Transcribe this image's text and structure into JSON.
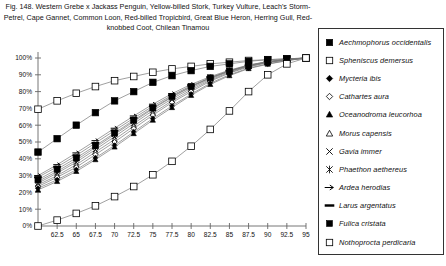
{
  "figure": {
    "caption": "Fig. 148.  Western Grebe x Jackass Penguin, Yellow-billed Stork, Turkey Vulture, Leach's Storm-Petrel, Cape Gannet, Common Loon, Red-billed Tropicbird, Great Blue Heron, Herring Gull, Red-knobbed Coot, Chilean Tinamou"
  },
  "legend": {
    "position": "right",
    "items": [
      {
        "label": "Aechmophorus occidentalis",
        "marker": "filled-square"
      },
      {
        "label": "Spheniscus demersus",
        "marker": "open-square"
      },
      {
        "label": "Mycteria ibis",
        "marker": "filled-diamond"
      },
      {
        "label": "Cathartes aura",
        "marker": "open-diamond"
      },
      {
        "label": "Oceanodroma leucorhoa",
        "marker": "filled-triangle"
      },
      {
        "label": "Morus capensis",
        "marker": "open-triangle"
      },
      {
        "label": "Gavia immer",
        "marker": "cross-x"
      },
      {
        "label": "Phaethon aethereus",
        "marker": "asterisk"
      },
      {
        "label": "Ardea herodias",
        "marker": "dash-arrow"
      },
      {
        "label": "Larus argentatus",
        "marker": "dash"
      },
      {
        "label": "Fulica cristata",
        "marker": "filled-square-small"
      },
      {
        "label": "Nothoprocta perdicaria",
        "marker": "open-square-small"
      }
    ]
  },
  "chart_data": {
    "type": "line",
    "title": "",
    "xlabel": "",
    "ylabel": "",
    "xlim": [
      60,
      95
    ],
    "ylim": [
      0,
      1.0
    ],
    "grid": false,
    "x": [
      60,
      62.5,
      65,
      67.5,
      70,
      72.5,
      75,
      77.5,
      80,
      82.5,
      85,
      87.5,
      90,
      92.5,
      95
    ],
    "xtick_labels": [
      "",
      "62.5",
      "65",
      "67.5",
      "70",
      "72.5",
      "75",
      "77.5",
      "80",
      "82.5",
      "85",
      "87.5",
      "90",
      "92.5",
      "95"
    ],
    "ytick_labels": [
      "0%",
      "10%",
      "20%",
      "30%",
      "40%",
      "50%",
      "60%",
      "70%",
      "80%",
      "90%",
      "100%"
    ],
    "ytick_values": [
      0,
      0.1,
      0.2,
      0.3,
      0.4,
      0.5,
      0.6,
      0.7,
      0.8,
      0.9,
      1.0
    ],
    "series": [
      {
        "name": "Aechmophorus occidentalis",
        "marker": "filled-square",
        "values": [
          0.44,
          0.52,
          0.6,
          0.675,
          0.745,
          0.8,
          0.855,
          0.895,
          0.925,
          0.95,
          0.965,
          0.98,
          0.99,
          0.995,
          1.0
        ]
      },
      {
        "name": "Spheniscus demersus",
        "marker": "open-square",
        "values": [
          0.695,
          0.745,
          0.79,
          0.83,
          0.865,
          0.89,
          0.915,
          0.935,
          0.95,
          0.965,
          0.975,
          0.985,
          0.99,
          0.995,
          1.0
        ]
      },
      {
        "name": "Mycteria ibis",
        "marker": "filled-diamond",
        "values": [
          0.225,
          0.275,
          0.335,
          0.405,
          0.48,
          0.56,
          0.64,
          0.715,
          0.785,
          0.85,
          0.9,
          0.94,
          0.965,
          0.985,
          1.0
        ]
      },
      {
        "name": "Cathartes aura",
        "marker": "open-diamond",
        "values": [
          0.235,
          0.29,
          0.35,
          0.425,
          0.5,
          0.58,
          0.66,
          0.735,
          0.8,
          0.862,
          0.91,
          0.947,
          0.972,
          0.988,
          1.0
        ]
      },
      {
        "name": "Oceanodroma leucorhoa",
        "marker": "filled-triangle",
        "values": [
          0.215,
          0.265,
          0.325,
          0.395,
          0.47,
          0.55,
          0.63,
          0.705,
          0.778,
          0.843,
          0.895,
          0.937,
          0.963,
          0.984,
          1.0
        ]
      },
      {
        "name": "Morus capensis",
        "marker": "open-triangle",
        "values": [
          0.245,
          0.3,
          0.365,
          0.44,
          0.515,
          0.595,
          0.672,
          0.745,
          0.81,
          0.868,
          0.915,
          0.95,
          0.974,
          0.99,
          1.0
        ]
      },
      {
        "name": "Gavia immer",
        "marker": "cross-x",
        "values": [
          0.255,
          0.315,
          0.38,
          0.455,
          0.532,
          0.61,
          0.687,
          0.757,
          0.82,
          0.875,
          0.92,
          0.954,
          0.977,
          0.991,
          1.0
        ]
      },
      {
        "name": "Phaethon aethereus",
        "marker": "asterisk",
        "values": [
          0.265,
          0.325,
          0.392,
          0.468,
          0.545,
          0.622,
          0.698,
          0.767,
          0.828,
          0.881,
          0.924,
          0.957,
          0.978,
          0.992,
          1.0
        ]
      },
      {
        "name": "Ardea herodias",
        "marker": "dash-arrow",
        "values": [
          0.3,
          0.365,
          0.435,
          0.508,
          0.582,
          0.655,
          0.725,
          0.788,
          0.843,
          0.889,
          0.928,
          0.958,
          0.979,
          0.993,
          1.0
        ]
      },
      {
        "name": "Larus argentatus",
        "marker": "dash",
        "values": [
          0.29,
          0.352,
          0.42,
          0.494,
          0.568,
          0.642,
          0.713,
          0.778,
          0.835,
          0.883,
          0.923,
          0.955,
          0.977,
          0.992,
          1.0
        ]
      },
      {
        "name": "Fulica cristata",
        "marker": "filled-square-small",
        "values": [
          0.275,
          0.338,
          0.405,
          0.478,
          0.553,
          0.63,
          0.703,
          0.771,
          0.831,
          0.882,
          0.922,
          0.953,
          0.976,
          0.991,
          1.0
        ]
      },
      {
        "name": "Nothoprocta perdicaria",
        "marker": "open-square-small",
        "values": [
          0.0,
          0.035,
          0.075,
          0.12,
          0.175,
          0.235,
          0.305,
          0.385,
          0.475,
          0.575,
          0.685,
          0.8,
          0.9,
          0.965,
          1.0
        ]
      }
    ]
  }
}
